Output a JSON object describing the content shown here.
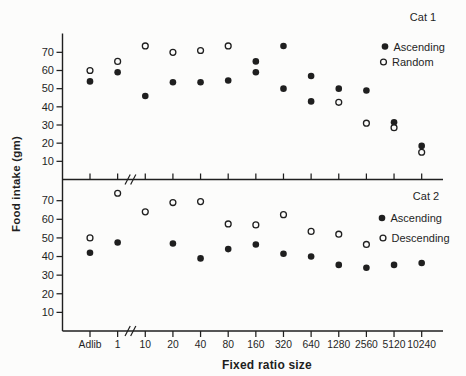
{
  "figure": {
    "x_axis_title": "Fixed ratio size",
    "y_axis_title": "Food intake (gm)"
  },
  "axis": {
    "categories": [
      "Adlib",
      "1",
      "10",
      "20",
      "40",
      "80",
      "160",
      "320",
      "640",
      "1280",
      "2560",
      "5120",
      "10240"
    ],
    "break_after_category": "1",
    "ylim": [
      0,
      80
    ],
    "yticks": [
      10,
      20,
      30,
      40,
      50,
      60,
      70
    ]
  },
  "colors": {
    "ink": "#1f1f1f",
    "paper": "#fcfcfb"
  },
  "chart_data": [
    {
      "type": "scatter",
      "panel_label": "Cat 1",
      "legend": [
        {
          "marker": "filled",
          "label": "Ascending"
        },
        {
          "marker": "open",
          "label": "Random"
        }
      ],
      "points": [
        {
          "x": "Adlib",
          "series": "Random",
          "marker": "open",
          "v": 60
        },
        {
          "x": "Adlib",
          "series": "Ascending",
          "marker": "filled",
          "v": 54
        },
        {
          "x": "1",
          "series": "Random",
          "marker": "open",
          "v": 65
        },
        {
          "x": "1",
          "series": "Ascending",
          "marker": "filled",
          "v": 59
        },
        {
          "x": "10",
          "series": "Random",
          "marker": "open",
          "v": 73.5
        },
        {
          "x": "10",
          "series": "Ascending",
          "marker": "filled",
          "v": 46
        },
        {
          "x": "20",
          "series": "Random",
          "marker": "open",
          "v": 70
        },
        {
          "x": "20",
          "series": "Ascending",
          "marker": "filled",
          "v": 53.5
        },
        {
          "x": "40",
          "series": "Random",
          "marker": "open",
          "v": 71
        },
        {
          "x": "40",
          "series": "Ascending",
          "marker": "filled",
          "v": 53.5
        },
        {
          "x": "80",
          "series": "Random",
          "marker": "open",
          "v": 73.5
        },
        {
          "x": "80",
          "series": "Ascending",
          "marker": "filled",
          "v": 54.5
        },
        {
          "x": "160",
          "series": "Ascending",
          "marker": "filled",
          "v": 65
        },
        {
          "x": "160",
          "series": "Random",
          "marker": "filled",
          "v": 59
        },
        {
          "x": "320",
          "series": "Ascending",
          "marker": "filled",
          "v": 73.5
        },
        {
          "x": "320",
          "series": "Random",
          "marker": "filled",
          "v": 50
        },
        {
          "x": "640",
          "series": "Ascending",
          "marker": "filled",
          "v": 57
        },
        {
          "x": "640",
          "series": "Random",
          "marker": "filled",
          "v": 43
        },
        {
          "x": "1280",
          "series": "Ascending",
          "marker": "filled",
          "v": 50
        },
        {
          "x": "1280",
          "series": "Random",
          "marker": "open",
          "v": 42.5
        },
        {
          "x": "2560",
          "series": "Ascending",
          "marker": "filled",
          "v": 49
        },
        {
          "x": "2560",
          "series": "Random",
          "marker": "open",
          "v": 31
        },
        {
          "x": "5120",
          "series": "Ascending",
          "marker": "filled",
          "v": 31.5
        },
        {
          "x": "5120",
          "series": "Random",
          "marker": "open",
          "v": 28.5
        },
        {
          "x": "10240",
          "series": "Ascending",
          "marker": "filled",
          "v": 18.5
        },
        {
          "x": "10240",
          "series": "Random",
          "marker": "open",
          "v": 15
        }
      ]
    },
    {
      "type": "scatter",
      "panel_label": "Cat 2",
      "legend": [
        {
          "marker": "filled",
          "label": "Ascending"
        },
        {
          "marker": "open",
          "label": "Descending"
        }
      ],
      "points": [
        {
          "x": "Adlib",
          "series": "Descending",
          "marker": "open",
          "v": 50
        },
        {
          "x": "Adlib",
          "series": "Ascending",
          "marker": "filled",
          "v": 42
        },
        {
          "x": "1",
          "series": "Descending",
          "marker": "open",
          "v": 74
        },
        {
          "x": "1",
          "series": "Ascending",
          "marker": "filled",
          "v": 47.5
        },
        {
          "x": "10",
          "series": "Descending",
          "marker": "open",
          "v": 64
        },
        {
          "x": "20",
          "series": "Descending",
          "marker": "open",
          "v": 69
        },
        {
          "x": "20",
          "series": "Ascending",
          "marker": "filled",
          "v": 47
        },
        {
          "x": "40",
          "series": "Descending",
          "marker": "open",
          "v": 69.5
        },
        {
          "x": "40",
          "series": "Ascending",
          "marker": "filled",
          "v": 39
        },
        {
          "x": "80",
          "series": "Descending",
          "marker": "open",
          "v": 57.5
        },
        {
          "x": "80",
          "series": "Ascending",
          "marker": "filled",
          "v": 44
        },
        {
          "x": "160",
          "series": "Descending",
          "marker": "open",
          "v": 57
        },
        {
          "x": "160",
          "series": "Ascending",
          "marker": "filled",
          "v": 46.5
        },
        {
          "x": "320",
          "series": "Descending",
          "marker": "open",
          "v": 62.5
        },
        {
          "x": "320",
          "series": "Ascending",
          "marker": "filled",
          "v": 41.5
        },
        {
          "x": "640",
          "series": "Descending",
          "marker": "open",
          "v": 53.5
        },
        {
          "x": "640",
          "series": "Ascending",
          "marker": "filled",
          "v": 40
        },
        {
          "x": "1280",
          "series": "Descending",
          "marker": "open",
          "v": 52
        },
        {
          "x": "1280",
          "series": "Ascending",
          "marker": "filled",
          "v": 35.5
        },
        {
          "x": "2560",
          "series": "Descending",
          "marker": "open",
          "v": 46.5
        },
        {
          "x": "2560",
          "series": "Ascending",
          "marker": "filled",
          "v": 34
        },
        {
          "x": "5120",
          "series": "Ascending",
          "marker": "filled",
          "v": 35.5
        },
        {
          "x": "10240",
          "series": "Ascending",
          "marker": "filled",
          "v": 36.5
        }
      ]
    }
  ]
}
